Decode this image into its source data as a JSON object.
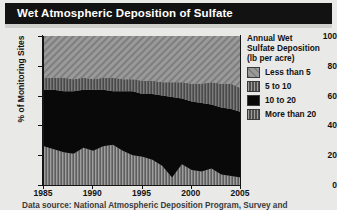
{
  "title": "Wet Atmospheric Deposition of Sulfate",
  "footer": "Data source: National Atmospheric Deposition Program, Survey and",
  "legend": {
    "title_line1": "Annual Wet",
    "title_line2": "Sulfate Deposition",
    "title_line3": "(lb per acre)",
    "items": [
      {
        "label": "Less than 5",
        "pattern": "diagonal-hatch",
        "color": "#8d8d8d"
      },
      {
        "label": "5 to 10",
        "pattern": "vertical-bars",
        "color": "#6a6a6a"
      },
      {
        "label": "10 to 20",
        "pattern": "solid",
        "color": "#0a0a0a"
      },
      {
        "label": "More than 20",
        "pattern": "vertical-bars",
        "color": "#8a8a8a"
      }
    ]
  },
  "chart_data": {
    "type": "area",
    "title": "Wet Atmospheric Deposition of Sulfate",
    "xlabel": "",
    "ylabel": "% of Monitoring Sites",
    "xlim": [
      1985,
      2005
    ],
    "ylim": [
      0,
      100
    ],
    "ytick_labels": [
      "0",
      "20",
      "40",
      "60",
      "80",
      "100"
    ],
    "ytick_values": [
      0,
      20,
      40,
      60,
      80,
      100
    ],
    "xtick_labels": [
      "1985",
      "1990",
      "1995",
      "2000",
      "2005"
    ],
    "xtick_values": [
      1985,
      1990,
      1995,
      2000,
      2005
    ],
    "grid": false,
    "legend_position": "right",
    "stacked": true,
    "x": [
      1985,
      1986,
      1987,
      1988,
      1989,
      1990,
      1991,
      1992,
      1993,
      1994,
      1995,
      1996,
      1997,
      1998,
      1999,
      2000,
      2001,
      2002,
      2003,
      2004,
      2005
    ],
    "series": [
      {
        "name": "More than 20",
        "values": [
          26,
          24,
          22,
          21,
          25,
          23,
          26,
          27,
          23,
          20,
          19,
          17,
          13,
          5,
          14,
          10,
          9,
          11,
          7,
          6,
          5
        ]
      },
      {
        "name": "10 to 20",
        "values": [
          38,
          40,
          41,
          42,
          39,
          41,
          38,
          36,
          40,
          43,
          42,
          44,
          47,
          54,
          44,
          46,
          46,
          43,
          45,
          45,
          44
        ]
      },
      {
        "name": "5 to 10",
        "values": [
          8,
          8,
          9,
          8,
          8,
          7,
          8,
          9,
          8,
          8,
          9,
          9,
          9,
          10,
          11,
          12,
          13,
          15,
          16,
          17,
          16
        ]
      },
      {
        "name": "Less than 5",
        "values": [
          28,
          28,
          28,
          29,
          28,
          29,
          28,
          28,
          29,
          29,
          30,
          30,
          31,
          31,
          31,
          32,
          32,
          31,
          32,
          32,
          35
        ]
      }
    ]
  }
}
